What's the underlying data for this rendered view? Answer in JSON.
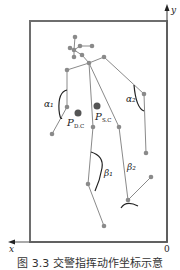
{
  "diagram": {
    "type": "skeleton-pose-diagram",
    "axes": {
      "y_label": "y",
      "x_label": "x",
      "origin_label": "0"
    },
    "labels": {
      "alpha1": "α₁",
      "alpha2": "α₂",
      "beta1": "β₁",
      "beta2": "β₂",
      "p_dc": "P",
      "p_dc_sub": "D.C",
      "p_sc": "P",
      "p_sc_sub": "S.C"
    },
    "colors": {
      "line": "#8a8a8a",
      "joint": "#8a8a8a",
      "arc": "#222222",
      "frame": "#6e6e6e",
      "centroid": "#555555"
    }
  },
  "caption": "图 3.3  交警指挥动作坐标示意"
}
